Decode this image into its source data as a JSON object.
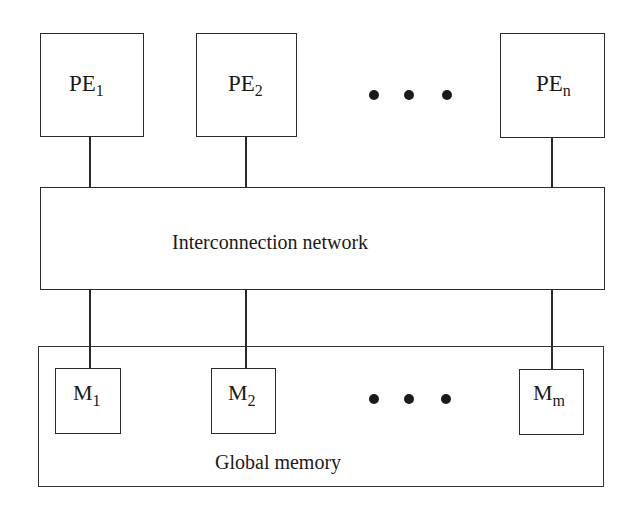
{
  "diagram": {
    "processors": [
      {
        "base": "PE",
        "sub": "1"
      },
      {
        "base": "PE",
        "sub": "2"
      },
      {
        "base": "PE",
        "sub": "n"
      }
    ],
    "network": {
      "label": "Interconnection network"
    },
    "memories": [
      {
        "base": "M",
        "sub": "1"
      },
      {
        "base": "M",
        "sub": "2"
      },
      {
        "base": "M",
        "sub": "m"
      }
    ],
    "global_memory": {
      "label": "Global memory"
    },
    "ellipsis": "• • •"
  }
}
